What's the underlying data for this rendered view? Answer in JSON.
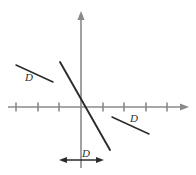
{
  "figure": {
    "background_color": "#ffffff",
    "axis_color": "#8a8a8a",
    "line_color": "#2b2b2b",
    "label_color": "#2b2b2b",
    "width": 196,
    "height": 175
  },
  "axes": {
    "origin": {
      "x": 81,
      "y": 107
    },
    "x_axis": {
      "name": "horizontal-axis",
      "start_x": 8,
      "end_x": 188,
      "y": 107,
      "arrow_right": true,
      "arrow_left": false,
      "tick_length": 9,
      "tick_positions_x": [
        16,
        38,
        59,
        81,
        103,
        124,
        146,
        167
      ],
      "tick_count": 8
    },
    "y_axis": {
      "name": "vertical-axis",
      "x": 81,
      "start_y": 168,
      "end_y": 12,
      "arrow_up": true,
      "arrow_down": false
    }
  },
  "plotted_line": {
    "name": "steep-negative-slope-line",
    "x1": 60,
    "y1": 62,
    "x2": 110,
    "y2": 150,
    "passes_through_origin": true,
    "slope_sign": "negative"
  },
  "segments": [
    {
      "name": "upper-left-reference-segment",
      "x1": 16,
      "y1": 65,
      "x2": 53,
      "y2": 82,
      "label": "D",
      "label_x": 29,
      "label_y": 81
    },
    {
      "name": "lower-right-reference-segment",
      "x1": 112,
      "y1": 117,
      "x2": 149,
      "y2": 134,
      "label": "D",
      "label_x": 134,
      "label_y": 122
    }
  ],
  "measure_arrow": {
    "name": "horizontal-double-arrow",
    "x1": 60,
    "x2": 103,
    "y": 160,
    "double_headed": true,
    "label": "D",
    "label_x": 85,
    "label_y": 156
  }
}
